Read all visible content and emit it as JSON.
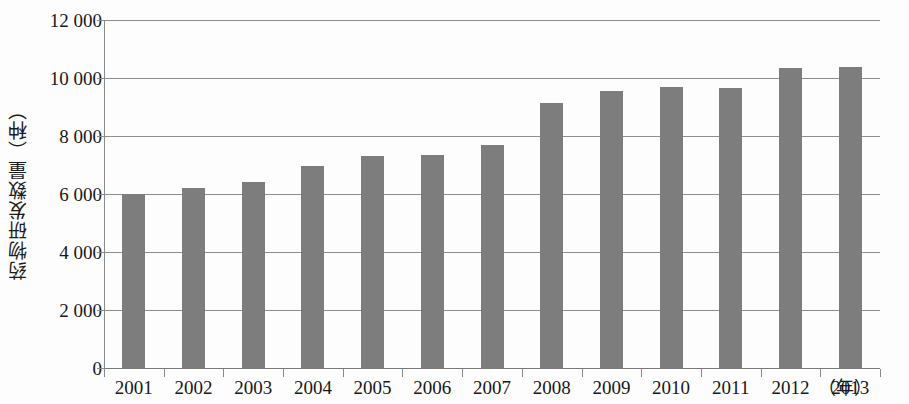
{
  "chart_data": {
    "type": "bar",
    "title": "",
    "subtitle": "",
    "xlabel": "（年）",
    "ylabel": "药物研发数量（种）",
    "categories": [
      "2001",
      "2002",
      "2003",
      "2004",
      "2005",
      "2006",
      "2007",
      "2008",
      "2009",
      "2010",
      "2011",
      "2012",
      "2013"
    ],
    "values": [
      6000,
      6200,
      6400,
      6950,
      7300,
      7350,
      7680,
      9150,
      9550,
      9680,
      9650,
      10350,
      10380
    ],
    "series": [
      {
        "name": "药物研发数量",
        "values": [
          6000,
          6200,
          6400,
          6950,
          7300,
          7350,
          7680,
          9150,
          9550,
          9680,
          9650,
          10350,
          10380
        ]
      }
    ],
    "ylim": [
      0,
      12000
    ],
    "y_ticks": [
      0,
      2000,
      4000,
      6000,
      8000,
      10000,
      12000
    ],
    "y_tick_labels": [
      "0",
      "2 000",
      "4 000",
      "6 000",
      "8 000",
      "10 000",
      "12 000"
    ],
    "grid": true,
    "grid_axis": "y",
    "legend": false,
    "legend_position": "none",
    "bar_color": "#7d7d7d",
    "axis_color": "#8a8a8a",
    "background_color": "#fdfdfd",
    "text_color": "#181818"
  }
}
